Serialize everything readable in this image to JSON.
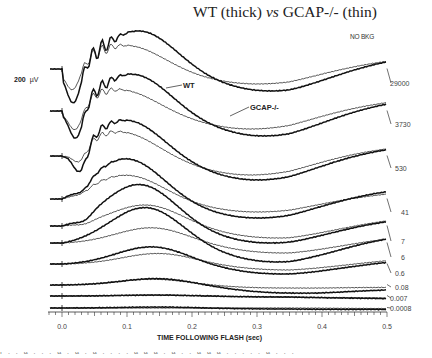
{
  "chart_data": {
    "type": "line",
    "title": "WT (thick) vs GCAP-/- (thin)",
    "subtitle": "NO BKG",
    "xlabel": "TIME FOLLOWING FLASH (sec)",
    "ylabel": "",
    "scale_bar": "200 µV",
    "xlim": [
      0.0,
      0.5
    ],
    "xticks": [
      "0.0",
      "0.1",
      "0.2",
      "0.3",
      "0.4",
      "0.5"
    ],
    "grid": false,
    "legend": {
      "thick": "WT",
      "thin": "GCAP-/-"
    },
    "annotations": [
      "WT",
      "GCAP-/-"
    ],
    "series_note": "Stacked ERG traces at each flash intensity; thick = WT, thin = GCAP-/-",
    "intensities": [
      "29000",
      "3730",
      "530",
      "41",
      "7",
      "6",
      "0.6",
      "0.08",
      "0.007",
      "0.0008"
    ],
    "traces": [
      {
        "label": "29000",
        "baseline": 69,
        "label_y": 85,
        "wt": {
          "a_depth": 38,
          "a_t": 0.018,
          "b_peak": 40,
          "b_t": 0.12,
          "osc": 8,
          "under": 22,
          "end": 17
        },
        "gcap": {
          "a_depth": 25,
          "a_t": 0.017,
          "b_peak": 25,
          "b_t": 0.1,
          "osc": 6,
          "under": 15,
          "end": 15
        }
      },
      {
        "label": "3730",
        "baseline": 111,
        "label_y": 126,
        "wt": {
          "a_depth": 34,
          "a_t": 0.022,
          "b_peak": 39,
          "b_t": 0.11,
          "osc": 6,
          "under": 25,
          "end": 16
        },
        "gcap": {
          "a_depth": 25,
          "a_t": 0.021,
          "b_peak": 23,
          "b_t": 0.09,
          "osc": 4,
          "under": 18,
          "end": 16
        }
      },
      {
        "label": "530",
        "baseline": 156,
        "label_y": 170,
        "wt": {
          "a_depth": 27,
          "a_t": 0.028,
          "b_peak": 38,
          "b_t": 0.1,
          "osc": 4,
          "under": 24,
          "end": 14
        },
        "gcap": {
          "a_depth": 15,
          "a_t": 0.027,
          "b_peak": 26,
          "b_t": 0.09,
          "osc": 3,
          "under": 19,
          "end": 14
        }
      },
      {
        "label": "41",
        "baseline": 199,
        "label_y": 214,
        "wt": {
          "a_depth": 7,
          "a_t": 0.032,
          "b_peak": 42,
          "b_t": 0.1,
          "osc": 1,
          "under": 19,
          "end": 15
        },
        "gcap": {
          "a_depth": 3,
          "a_t": 0.03,
          "b_peak": 25,
          "b_t": 0.1,
          "osc": 1,
          "under": 13,
          "end": 10
        }
      },
      {
        "label": "7",
        "baseline": 226,
        "label_y": 243,
        "wt": {
          "a_depth": 5,
          "a_t": 0.035,
          "b_peak": 43,
          "b_t": 0.12,
          "osc": 0,
          "under": 17,
          "end": 11
        },
        "gcap": {
          "a_depth": 2,
          "a_t": 0.035,
          "b_peak": 22,
          "b_t": 0.13,
          "osc": 0,
          "under": 12,
          "end": 12
        }
      },
      {
        "label": "6",
        "baseline": 243,
        "label_y": 259,
        "wt": {
          "a_depth": 0,
          "a_t": 0.04,
          "b_peak": 37,
          "b_t": 0.13,
          "osc": 0,
          "under": 19,
          "end": 12
        },
        "gcap": {
          "a_depth": 0,
          "a_t": 0.04,
          "b_peak": 16,
          "b_t": 0.14,
          "osc": 0,
          "under": 10,
          "end": 10
        }
      },
      {
        "label": "0.6",
        "baseline": 264,
        "label_y": 275,
        "wt": {
          "a_depth": 0,
          "a_t": 0.04,
          "b_peak": 18,
          "b_t": 0.14,
          "osc": 0,
          "under": 10,
          "end": 6
        },
        "gcap": {
          "a_depth": 0,
          "a_t": 0.04,
          "b_peak": 11,
          "b_t": 0.15,
          "osc": 0,
          "under": 6,
          "end": 8
        }
      },
      {
        "label": "0.08",
        "baseline": 285,
        "label_y": 289,
        "wt": {
          "a_depth": 0,
          "a_t": 0.04,
          "b_peak": 7,
          "b_t": 0.15,
          "osc": 0,
          "under": 8,
          "end": -5
        },
        "gcap": {
          "a_depth": 0,
          "a_t": 0.04,
          "b_peak": 6,
          "b_t": 0.14,
          "osc": 0,
          "under": 3,
          "end": -3
        }
      },
      {
        "label": "0.007",
        "baseline": 296,
        "label_y": 300,
        "wt": {
          "a_depth": 0,
          "a_t": 0.04,
          "b_peak": 1,
          "b_t": 0.15,
          "osc": 0,
          "under": 1,
          "end": -4
        },
        "gcap": {
          "a_depth": 0,
          "a_t": 0.04,
          "b_peak": 1,
          "b_t": 0.15,
          "osc": 0,
          "under": 1,
          "end": -3
        }
      },
      {
        "label": "0.0008",
        "baseline": 308,
        "label_y": 310,
        "wt": {
          "a_depth": 0,
          "a_t": 0.04,
          "b_peak": 1,
          "b_t": 0.15,
          "osc": 0,
          "under": 1,
          "end": -2
        },
        "gcap": {
          "a_depth": 0,
          "a_t": 0.04,
          "b_peak": 0,
          "b_t": 0.15,
          "osc": 0,
          "under": 0,
          "end": -1
        }
      }
    ]
  },
  "labels": {
    "title_a": "WT (thick) ",
    "title_vs": "vs",
    "title_b": " GCAP-/- (thin)",
    "nobkg": "NO BKG",
    "scale_value": "200",
    "scale_unit": "µV",
    "anno_wt": "WT",
    "anno_gcap": "GCAP-/-",
    "xlabel": "TIME FOLLOWING FLASH (sec)",
    "caption_fragment": "f . . a . . . a . a . a . . . . a a a . a . . a a a . . . . . a . . . . ."
  },
  "layout": {
    "x0_px": 62,
    "x1_px": 387,
    "trace_start_px": 50,
    "axis_y": 312,
    "colors": {
      "trace": "#111111",
      "axis": "#333333",
      "text": "#222222"
    }
  }
}
